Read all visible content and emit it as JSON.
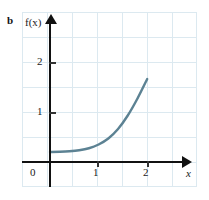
{
  "figure": {
    "panel_label": "b",
    "axis_labels": {
      "y": "f(x)",
      "x": "x"
    }
  },
  "chart_data": {
    "type": "line",
    "title": "",
    "xlabel": "x",
    "ylabel": "f(x)",
    "xlim": [
      -0.55,
      3.0
    ],
    "ylim": [
      -0.25,
      3.0
    ],
    "xticks": [
      0,
      1,
      2
    ],
    "xticklabels": [
      "0",
      "1",
      "2"
    ],
    "yticks": [
      1,
      2
    ],
    "yticklabels": [
      "1",
      "2"
    ],
    "grid": true,
    "grid_spacing": 0.5,
    "legend": "none",
    "origin_label": "0",
    "series": [
      {
        "name": "f(x)",
        "color": "#5c8293",
        "x": [
          0.0,
          0.2,
          0.4,
          0.6,
          0.8,
          1.0,
          1.2,
          1.4,
          1.6,
          1.8,
          2.0
        ],
        "y": [
          0.2,
          0.205,
          0.215,
          0.235,
          0.275,
          0.35,
          0.47,
          0.66,
          0.93,
          1.27,
          1.66
        ]
      }
    ]
  },
  "ticks": {
    "x": [
      {
        "label": "0",
        "value": 0
      },
      {
        "label": "1",
        "value": 1
      },
      {
        "label": "2",
        "value": 2
      }
    ],
    "y": [
      {
        "label": "1",
        "value": 1
      },
      {
        "label": "2",
        "value": 2
      }
    ]
  },
  "colors": {
    "curve": "#5c8293",
    "grid": "#dce9f0",
    "axis": "#111111",
    "background": "#ffffff"
  }
}
